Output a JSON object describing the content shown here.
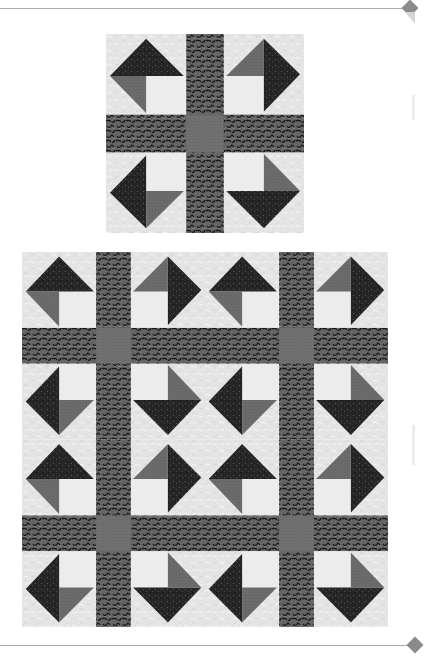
{
  "page": {
    "decorations": {
      "top_rule": true,
      "bottom_rule": true,
      "corner_diamond_color": "#8a8a8a",
      "rule_color": "#a9a9a9"
    }
  },
  "fabrics": {
    "background_light": "#e4e4e4",
    "dark_print": "#262626",
    "medium_gray": "#6b6b6b",
    "sashing_print": "#5a5a5a",
    "center_square": "#707070"
  },
  "figures": [
    {
      "name": "single-block",
      "description": "Single quilt block with cross sashing and four pinwheel corner units",
      "rows": 1,
      "cols": 1,
      "x": 106,
      "y": 34,
      "width": 198,
      "height": 199
    },
    {
      "name": "four-block-quilt",
      "description": "Four blocks set 2 by 2",
      "rows": 2,
      "cols": 2,
      "x": 22,
      "y": 252,
      "width": 366,
      "height": 375
    }
  ],
  "block_layout": {
    "quadrant_order": [
      "top-left",
      "top-right",
      "bottom-left",
      "bottom-right"
    ],
    "sashing_ratio": 0.19
  }
}
